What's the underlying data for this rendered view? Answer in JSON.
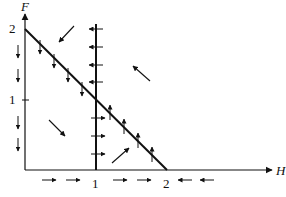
{
  "diagram": {
    "axes": {
      "x_label": "H",
      "y_label": "F",
      "x_ticks": [
        "1",
        "2"
      ],
      "y_ticks": [
        "1",
        "2"
      ]
    },
    "lines": [
      {
        "name": "diagonal-nullcline",
        "from": [
          0,
          2
        ],
        "to": [
          2,
          0
        ]
      },
      {
        "name": "vertical-nullcline",
        "at_H": 1
      }
    ],
    "colors": {
      "ink": "#111111",
      "background": "#ffffff"
    }
  }
}
